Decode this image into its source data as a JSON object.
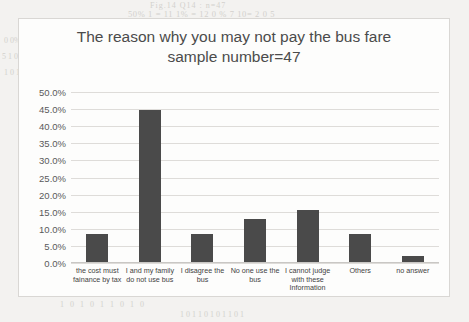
{
  "chart_data": {
    "type": "bar",
    "title": "The reason why you may not pay the bus fare",
    "subtitle": "sample number=47",
    "xlabel": "",
    "ylabel": "",
    "ylim": [
      0,
      50
    ],
    "grid": true,
    "legend": "none",
    "bar_color": "#4a4a4a",
    "plot_background": "#fdfdfc",
    "border_color": "#d9d7d4",
    "ytick_labels": [
      "50.0%",
      "45.0%",
      "40.0%",
      "35.0%",
      "30.0%",
      "25.0%",
      "20.0%",
      "15.0%",
      "10.0%",
      "5.0%",
      "0.0%"
    ],
    "ytick_values": [
      50,
      45,
      40,
      35,
      30,
      25,
      20,
      15,
      10,
      5,
      0
    ],
    "categories": [
      "the cost must fainance by tax",
      "I and my family do not use bus",
      "I disagree the bus",
      "No one use the bus",
      "I cannot judge with these Information",
      "Others",
      "no answer"
    ],
    "category_lines": [
      [
        "the cost must",
        "fainance by tax"
      ],
      [
        "I and my family",
        "do not use bus"
      ],
      [
        "I disagree the",
        "bus"
      ],
      [
        "No one use the",
        "bus"
      ],
      [
        "I cannot judge",
        "with these",
        "Information"
      ],
      [
        "Others"
      ],
      [
        "no answer"
      ]
    ],
    "values": [
      8.5,
      44.7,
      8.5,
      12.8,
      15.5,
      8.5,
      2.1
    ]
  },
  "background_bleed": {
    "line1": "Fig.14  Q14  : n=47",
    "line2": "50% 1 = 11 1%  = 12 0 %  7  10=  2 0 5",
    "line3": "Fig.14 Q14  : n=47",
    "line4": "0 0%",
    "line5": "5 1 0 1 1 0 1 0 1 0 1 1 0 1  0 1 1 0 1 0 1 1 0",
    "line6": "1 0 1 1 1 0 1 0 1 1 0 1 0 1 1 0 1 0 1 0 1 0 1",
    "line7": "1 1 0 1 0 0 1 1 0",
    "line8": "0 1 0 0 1 1 0 1 1 0",
    "line9": "1 0 1 1 0 1 0 1 1",
    "line10": "0 1 1 0 1 0",
    "line11": "1 0 1 0 1 1 0 1 0",
    "line12": "1 0 1 1 0 1 0 1 1 0 1"
  }
}
